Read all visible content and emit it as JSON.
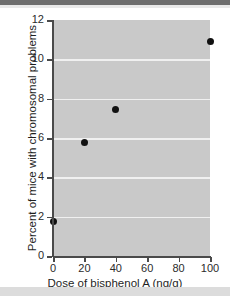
{
  "chart_data": {
    "type": "scatter",
    "title": "",
    "xlabel": "Dose of bisphenol A (ng/g)",
    "ylabel": "Percent of mice with chromosomal problems",
    "x": [
      0,
      20,
      40,
      100
    ],
    "values": [
      1.75,
      5.75,
      7.45,
      10.9
    ],
    "points": [
      {
        "x": 0,
        "y": 1.75
      },
      {
        "x": 20,
        "y": 5.75
      },
      {
        "x": 40,
        "y": 7.45
      },
      {
        "x": 100,
        "y": 10.9
      }
    ],
    "xlim": [
      0,
      100
    ],
    "ylim": [
      0,
      12
    ],
    "xticks": [
      0,
      20,
      40,
      60,
      80,
      100
    ],
    "yticks": [
      0,
      2,
      4,
      6,
      8,
      10,
      12
    ],
    "xticklabels": [
      "0",
      "20",
      "40",
      "60",
      "80",
      "100"
    ],
    "yticklabels": [
      "0",
      "2",
      "4",
      "6",
      "8",
      "10",
      "12"
    ],
    "gridlines_y": [
      2,
      4,
      6,
      8,
      10
    ],
    "grid": "horizontal-only",
    "legend": "none",
    "marker": "filled-circle",
    "colors": {
      "plot_background": "#c9c9c9",
      "gridline": "#f0f0f0",
      "marker": "#111111",
      "axis": "#4a4a4a",
      "text": "#1f1f1f",
      "page_background": "#ffffff",
      "top_band": "#6e6e6e",
      "bottom_band": "#dcdcdc"
    }
  }
}
